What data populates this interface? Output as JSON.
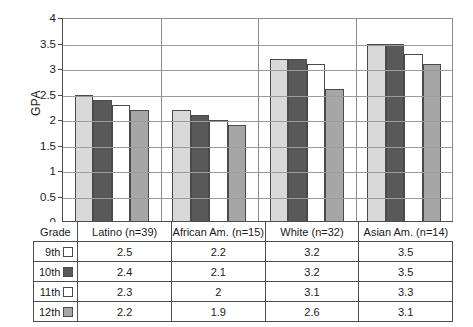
{
  "chart_data": {
    "type": "bar",
    "title": "",
    "xlabel": "",
    "ylabel": "GPA",
    "ylim": [
      0,
      4
    ],
    "ytick_step": 0.5,
    "yticks": [
      "4",
      "3.5",
      "3",
      "2.5",
      "2",
      "1.5",
      "1",
      "0.5",
      "0"
    ],
    "grid": true,
    "legend_position": "table-row-headers",
    "categories": [
      "Latino (n=39)",
      "African Am.  (n=15)",
      "White (n=32)",
      "Asian Am. (n=14)"
    ],
    "series": [
      {
        "name": "9th",
        "color": "#d9d9d9",
        "values": [
          2.5,
          2.2,
          3.2,
          3.5
        ]
      },
      {
        "name": "10th",
        "color": "#595959",
        "values": [
          2.4,
          2.1,
          3.2,
          3.5
        ]
      },
      {
        "name": "11th",
        "color": "#ffffff",
        "values": [
          2.3,
          2.0,
          3.1,
          3.3
        ]
      },
      {
        "name": "12th",
        "color": "#a6a6a6",
        "values": [
          2.2,
          1.9,
          2.6,
          3.1
        ]
      }
    ]
  },
  "table": {
    "corner_header": "Grade",
    "column_headers": [
      "Latino (n=39)",
      "African Am.  (n=15)",
      "White (n=32)",
      "Asian Am. (n=14)"
    ],
    "rows": [
      {
        "grade": "9th",
        "swatch": "#ffffff",
        "values": [
          "2.5",
          "2.2",
          "3.2",
          "3.5"
        ]
      },
      {
        "grade": "10th",
        "swatch": "#595959",
        "values": [
          "2.4",
          "2.1",
          "3.2",
          "3.5"
        ]
      },
      {
        "grade": "11th",
        "swatch": "#ffffff",
        "values": [
          "2.3",
          "2",
          "3.1",
          "3.3"
        ]
      },
      {
        "grade": "12th",
        "swatch": "#a6a6a6",
        "values": [
          "2.2",
          "1.9",
          "2.6",
          "3.1"
        ]
      }
    ]
  }
}
